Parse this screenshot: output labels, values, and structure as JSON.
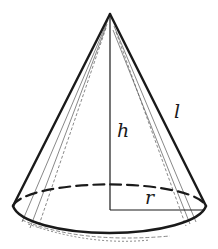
{
  "figure": {
    "labels": {
      "height": "h",
      "slant": "l",
      "radius": "r"
    },
    "colors": {
      "stroke": "#1a1a1a",
      "background": "#ffffff"
    }
  }
}
